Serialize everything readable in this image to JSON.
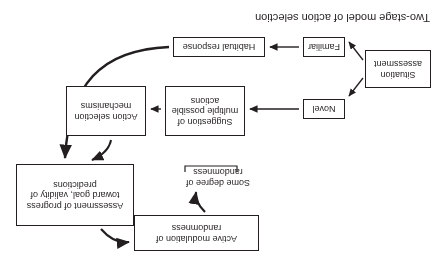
{
  "figure": {
    "caption": "Two-stage model of action selection",
    "orientation": "rotated-180",
    "nodes": {
      "situation_assessment": "Situation assessment",
      "novel": "Novel",
      "familiar": "Familiar",
      "habitual_response": "Habitual response",
      "suggestion": "Suggestion of multiple possible actions",
      "action_selection": "Action selection mechanisms",
      "assessment": "Assessment of progress toward goal, validity of predictions",
      "active_modulation": "Active modulation of randomness",
      "some_degree": "Some degree of randomness"
    },
    "edges": [
      {
        "from": "situation_assessment",
        "to": "novel",
        "style": "straight-arrow"
      },
      {
        "from": "situation_assessment",
        "to": "familiar",
        "style": "straight-arrow"
      },
      {
        "from": "novel",
        "to": "suggestion",
        "style": "straight-arrow"
      },
      {
        "from": "familiar",
        "to": "habitual_response",
        "style": "straight-arrow"
      },
      {
        "from": "suggestion",
        "to": "action_selection",
        "style": "straight-arrow"
      },
      {
        "from": "action_selection",
        "to": "assessment",
        "style": "curved-arrow"
      },
      {
        "from": "habitual_response",
        "to": "assessment",
        "style": "long-curved-arrow"
      },
      {
        "from": "assessment",
        "to": "active_modulation",
        "style": "curved-arrow"
      },
      {
        "from": "active_modulation",
        "to": "some_degree",
        "style": "curved-arrow"
      }
    ],
    "colors": {
      "ink": "#231f20",
      "background": "#ffffff"
    }
  }
}
